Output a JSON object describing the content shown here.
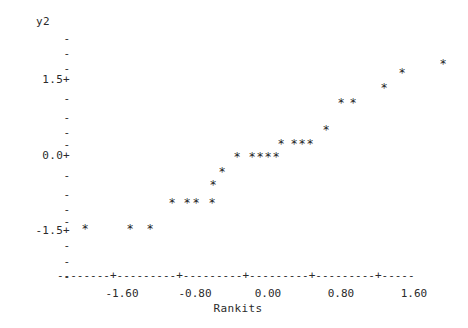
{
  "chart_data": {
    "type": "scatter",
    "title": "",
    "xlabel": "Rankits",
    "ylabel": "y2",
    "xlim": [
      -2.35,
      2.35
    ],
    "ylim": [
      -2.2,
      2.35
    ],
    "grid": false,
    "legend": null,
    "marker": "*",
    "x_ticks": [
      -1.6,
      -0.8,
      0.0,
      0.8,
      1.6
    ],
    "x_tick_labels": [
      "-1.60",
      "-0.80",
      "0.00",
      "0.80",
      "1.60"
    ],
    "y_ticks": [
      1.5,
      0.0,
      -1.5
    ],
    "y_tick_labels": [
      "1.5+",
      "0.0+",
      "-1.5+"
    ],
    "y_minor_tick_label": "-",
    "x": [
      -2.01,
      -1.38,
      -1.11,
      -0.81,
      -0.6,
      -0.49,
      -0.27,
      -0.14,
      0.0,
      0.21,
      0.41,
      0.52,
      0.63,
      0.74,
      0.82,
      1.0,
      1.11,
      1.21,
      1.3,
      1.52,
      1.67,
      1.82,
      2.04,
      2.6
    ],
    "y": [
      -1.55,
      -1.55,
      -1.55,
      -1.06,
      -1.06,
      -1.06,
      -1.06,
      -0.79,
      -0.53,
      -0.15,
      -0.15,
      -0.15,
      -0.15,
      -0.15,
      0.1,
      0.1,
      0.1,
      0.1,
      0.58,
      0.8,
      0.8,
      1.15,
      1.42,
      1.6
    ],
    "points": [
      {
        "px": 85,
        "py": 229
      },
      {
        "px": 130,
        "py": 229
      },
      {
        "px": 150,
        "py": 229
      },
      {
        "px": 172,
        "py": 203
      },
      {
        "px": 187,
        "py": 203
      },
      {
        "px": 196,
        "py": 203
      },
      {
        "px": 212,
        "py": 203
      },
      {
        "px": 213,
        "py": 185
      },
      {
        "px": 222,
        "py": 172
      },
      {
        "px": 237,
        "py": 157
      },
      {
        "px": 252,
        "py": 157
      },
      {
        "px": 260,
        "py": 157
      },
      {
        "px": 268,
        "py": 157
      },
      {
        "px": 276,
        "py": 157
      },
      {
        "px": 281,
        "py": 144
      },
      {
        "px": 294,
        "py": 144
      },
      {
        "px": 302,
        "py": 144
      },
      {
        "px": 310,
        "py": 144
      },
      {
        "px": 326,
        "py": 130
      },
      {
        "px": 341,
        "py": 103
      },
      {
        "px": 353,
        "py": 103
      },
      {
        "px": 384,
        "py": 88
      },
      {
        "px": 402,
        "py": 73
      },
      {
        "px": 443,
        "py": 64
      }
    ]
  },
  "axes": {
    "y_title": "y2",
    "y_labels": [
      {
        "text": "-",
        "top": 33
      },
      {
        "text": "-",
        "top": 48
      },
      {
        "text": "-",
        "top": 63
      },
      {
        "text": "1.5+",
        "top": 74
      },
      {
        "text": "-",
        "top": 93
      },
      {
        "text": "-",
        "top": 112
      },
      {
        "text": "-",
        "top": 127
      },
      {
        "text": "-",
        "top": 139
      },
      {
        "text": "0.0+",
        "top": 150
      },
      {
        "text": "-",
        "top": 170
      },
      {
        "text": "-",
        "top": 189
      },
      {
        "text": "-",
        "top": 204
      },
      {
        "text": "-",
        "top": 216
      },
      {
        "text": "-1.5+",
        "top": 225
      },
      {
        "text": "-",
        "top": 240
      },
      {
        "text": "-",
        "top": 256
      },
      {
        "text": "-",
        "top": 271
      }
    ],
    "x_axis_rule": "--------+---------+---------+---------+---------+-----",
    "x_tick_labels": [
      {
        "text": "-1.60",
        "center": 122
      },
      {
        "text": "-0.80",
        "center": 195
      },
      {
        "text": "0.00",
        "center": 268
      },
      {
        "text": "0.80",
        "center": 341
      },
      {
        "text": "1.60",
        "center": 414
      }
    ],
    "x_title": "Rankits"
  },
  "colors": {
    "background": "#ffffff",
    "ink": "#2b2b2b",
    "marker": "#1d1d1d"
  }
}
